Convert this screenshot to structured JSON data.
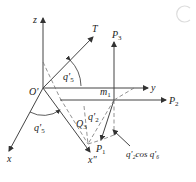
{
  "diagram": {
    "type": "3d-coordinate-frame",
    "labels": {
      "z": "z",
      "T": "T",
      "O_prime": "O'",
      "y": "y",
      "x": "x",
      "x_double_prime": "x\"",
      "P3": "P",
      "P3_sub": "3",
      "P2": "P",
      "P2_sub": "2",
      "P1": "P",
      "P1_sub": "1",
      "m1": "m",
      "m1_sub": "1",
      "Q3": "Q",
      "Q3_sub": "3",
      "q5_upper": "q'",
      "q5_upper_sub": "5",
      "q5_lower": "q'",
      "q5_lower_sub": "5",
      "q2": "q'",
      "q2_sub": "2",
      "annotation": "q'₂cos q'₆"
    },
    "colors": {
      "line": "#444444",
      "dash": "#777777",
      "text": "#222222"
    }
  }
}
